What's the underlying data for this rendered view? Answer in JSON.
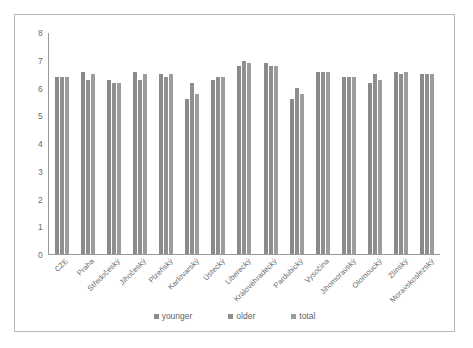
{
  "chart_data": {
    "type": "bar",
    "title": "",
    "subtitle": "",
    "xlabel": "",
    "ylabel": "",
    "ylim": [
      0,
      8
    ],
    "ytick_step": 1,
    "yticks": [
      8,
      7,
      6,
      5,
      4,
      3,
      2,
      1,
      0
    ],
    "grid": false,
    "legend_position": "bottom",
    "categories": [
      "CZE",
      "Praha",
      "Středočeský",
      "Jihočeský",
      "Plzeňský",
      "Karlovarský",
      "Ústecký",
      "Liberecký",
      "Královéhradecký",
      "Pardubický",
      "Vysočina",
      "Jihomoravský",
      "Olomoucký",
      "Zlínský",
      "Moravskoslezský"
    ],
    "series": [
      {
        "name": "younger",
        "color": "#8a8a8a",
        "values": [
          6.4,
          6.6,
          6.3,
          6.6,
          6.5,
          5.6,
          6.3,
          6.8,
          6.9,
          5.6,
          6.6,
          6.4,
          6.2,
          6.6,
          6.5
        ]
      },
      {
        "name": "older",
        "color": "#8f8f8f",
        "values": [
          6.4,
          6.3,
          6.2,
          6.3,
          6.4,
          6.2,
          6.4,
          7.0,
          6.8,
          6.0,
          6.6,
          6.4,
          6.5,
          6.5,
          6.5
        ]
      },
      {
        "name": "total",
        "color": "#9d9d9d",
        "values": [
          6.4,
          6.5,
          6.2,
          6.5,
          6.5,
          5.8,
          6.4,
          6.9,
          6.8,
          5.8,
          6.6,
          6.4,
          6.3,
          6.6,
          6.5
        ]
      }
    ]
  },
  "legend": {
    "items": [
      {
        "label": "younger"
      },
      {
        "label": "older"
      },
      {
        "label": "total"
      }
    ]
  },
  "colors": {
    "younger": "#8a8a8a",
    "older": "#8f8f8f",
    "total": "#9d9d9d",
    "axis": "#9a9a9a",
    "text": "#6b6b6b",
    "border": "#b8b8b8",
    "background": "#ffffff"
  }
}
